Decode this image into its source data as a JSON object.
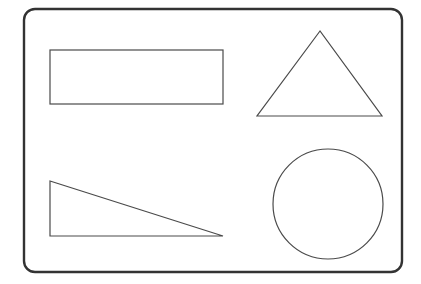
{
  "diagram": {
    "title": "",
    "colors": {
      "background": "#ffffff",
      "frame_stroke": "#333333",
      "shape_stroke": "#4a4a4a"
    },
    "frame": {
      "x": 24,
      "y": 9,
      "width": 378,
      "height": 263,
      "rx": 11,
      "stroke_width": 2.4
    },
    "shapes": [
      {
        "type": "rectangle",
        "name": "rectangle",
        "x": 50,
        "y": 50,
        "width": 173,
        "height": 54
      },
      {
        "type": "triangle",
        "name": "isosceles-triangle",
        "points": "320,31 257,116 382,116"
      },
      {
        "type": "triangle",
        "name": "right-triangle",
        "points": "50,181 50,236 223,236"
      },
      {
        "type": "circle",
        "name": "circle",
        "cx": 328,
        "cy": 204,
        "r": 55
      }
    ]
  }
}
